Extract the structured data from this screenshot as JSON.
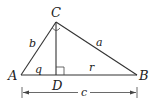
{
  "diagram": {
    "type": "right-triangle-with-altitude",
    "vertices": {
      "A": {
        "label": "A",
        "x": 21,
        "y": 75
      },
      "B": {
        "label": "B",
        "x": 137,
        "y": 75
      },
      "C": {
        "label": "C",
        "x": 56,
        "y": 22
      },
      "D": {
        "label": "D",
        "x": 56,
        "y": 75
      }
    },
    "sides": {
      "a": {
        "label": "a",
        "from": "C",
        "to": "B"
      },
      "b": {
        "label": "b",
        "from": "A",
        "to": "C"
      },
      "c": {
        "label": "c",
        "from": "A",
        "to": "B",
        "style": "dimension-line"
      },
      "q": {
        "label": "q",
        "from": "A",
        "to": "D"
      },
      "r": {
        "label": "r",
        "from": "D",
        "to": "B"
      }
    },
    "altitude": {
      "from": "C",
      "to": "D"
    },
    "marks": {
      "right_angle_at": "D",
      "angle_arc_at": "C"
    },
    "colors": {
      "stroke": "#333333",
      "text": "#222222",
      "background": "#ffffff"
    }
  }
}
